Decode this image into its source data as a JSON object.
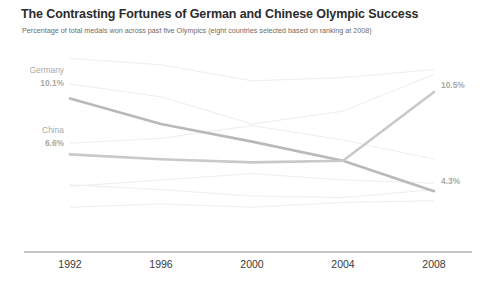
{
  "header": {
    "title": "The Contrasting Fortunes of German and Chinese Olympic Success",
    "subtitle": "Percentage of total medals won across past five Olympics (eight countries selected based on ranking at 2008)"
  },
  "chart_data": {
    "type": "line",
    "title": "The Contrasting Fortunes of German and Chinese Olympic Success",
    "subtitle": "Percentage of total medals won across past five Olympics (eight countries selected based on ranking at 2008)",
    "xlabel": "",
    "ylabel": "Percentage of total medals won",
    "categories": [
      "1992",
      "1996",
      "2000",
      "2004",
      "2008"
    ],
    "x_tick_labels": [
      "1992",
      "1996",
      "2000",
      "2004",
      "2008"
    ],
    "ylim": [
      2.0,
      13.0
    ],
    "grid": false,
    "legend": "none",
    "axis": "x-only",
    "highlight_colors": {
      "germany": "#b9b9b9",
      "china": "#c9c9c9",
      "other": "#ededed",
      "axis": "#8a8a8a",
      "label_text": "#a9a9a9"
    },
    "series": [
      {
        "name": "Germany",
        "highlighted": true,
        "color": "#b9b9b9",
        "start_label": "Germany",
        "start_value_label": "10.1%",
        "end_value_label": "4.3%",
        "values": [
          10.1,
          8.5,
          7.4,
          6.2,
          4.3
        ]
      },
      {
        "name": "China",
        "highlighted": true,
        "color": "#c9c9c9",
        "start_label": "China",
        "start_value_label": "6.6%",
        "end_value_label": "10.5%",
        "values": [
          6.6,
          6.3,
          6.1,
          6.2,
          10.5
        ]
      },
      {
        "name": "Other country 1",
        "highlighted": false,
        "color": "#ededed",
        "values": [
          12.6,
          12.2,
          11.2,
          11.4,
          11.9
        ]
      },
      {
        "name": "Other country 2",
        "highlighted": false,
        "color": "#ededed",
        "values": [
          11.0,
          10.2,
          8.5,
          9.3,
          11.6
        ]
      },
      {
        "name": "Other country 3",
        "highlighted": false,
        "color": "#ededed",
        "values": [
          7.3,
          7.6,
          8.4,
          7.5,
          6.3
        ]
      },
      {
        "name": "Other country 4",
        "highlighted": false,
        "color": "#ededed",
        "values": [
          4.6,
          5.0,
          5.4,
          5.0,
          4.8
        ]
      },
      {
        "name": "Other country 5",
        "highlighted": false,
        "color": "#ededed",
        "values": [
          4.7,
          4.4,
          4.0,
          3.9,
          4.4
        ]
      },
      {
        "name": "Other country 6",
        "highlighted": false,
        "color": "#ededed",
        "values": [
          3.3,
          3.5,
          3.3,
          3.6,
          3.7
        ]
      }
    ],
    "annotations": [
      {
        "text": "Germany",
        "position": "left-of-first-point"
      },
      {
        "text": "10.1%",
        "position": "left-of-first-point"
      },
      {
        "text": "China",
        "position": "left-of-first-point"
      },
      {
        "text": "6.6%",
        "position": "left-of-first-point"
      },
      {
        "text": "10.5%",
        "position": "right-of-last-point"
      },
      {
        "text": "4.3%",
        "position": "right-of-last-point"
      }
    ]
  },
  "labels": {
    "germany_name": "Germany",
    "germany_start": "10.1%",
    "germany_end": "4.3%",
    "china_name": "China",
    "china_start": "6.6%",
    "china_end": "10.5%"
  }
}
